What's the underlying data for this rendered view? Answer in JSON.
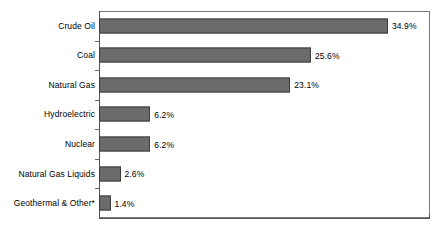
{
  "chart_data": {
    "type": "bar",
    "orientation": "horizontal",
    "title": "",
    "subtitle": "",
    "xlabel": "",
    "ylabel": "",
    "categories": [
      "Crude Oil",
      "Coal",
      "Natural Gas",
      "Hydroelectric",
      "Nuclear",
      "Natural Gas Liquids",
      "Geothermal & Other*"
    ],
    "values": [
      34.9,
      25.6,
      23.1,
      6.2,
      6.2,
      2.6,
      1.4
    ],
    "value_labels": [
      "34.9%",
      "25.6%",
      "23.1%",
      "6.2%",
      "6.2%",
      "2.6%",
      "1.4%"
    ],
    "xlim": [
      0,
      40
    ],
    "grid": false,
    "legend": null,
    "legend_position": "none",
    "bar_color": "#6b6b6b",
    "bar_border_color": "#3d3d3d",
    "plot_border_color": "#7a7a7a",
    "axis_color": "#555555",
    "background_color": "#ffffff",
    "annotations": []
  }
}
